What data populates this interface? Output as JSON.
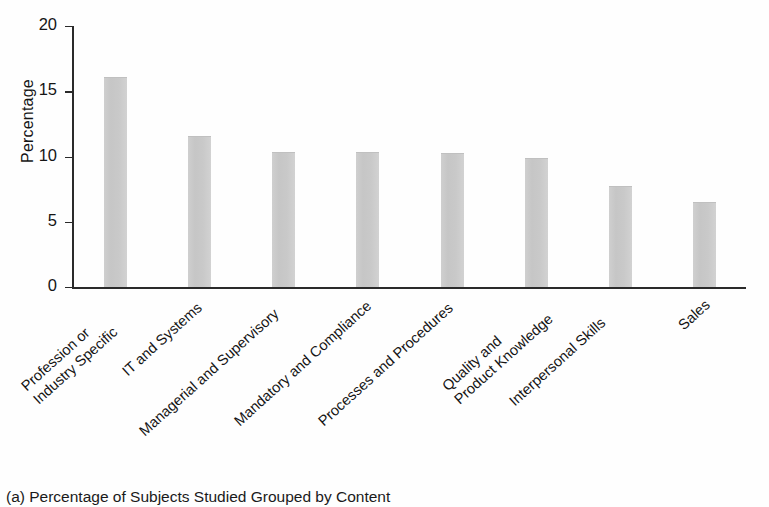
{
  "figure": {
    "background_color": "#fefefe",
    "axis_color": "#2a2a2a",
    "bar_color": "#c9c9c9"
  },
  "caption": {
    "text": "(a) Percentage of Subjects Studied Grouped by Content"
  },
  "chart_data": {
    "type": "bar",
    "title": "",
    "xlabel": "",
    "ylabel": "Percentage",
    "ylim": [
      0,
      20
    ],
    "yticks": [
      0,
      5,
      10,
      15,
      20
    ],
    "ytick_labels": [
      "0",
      "5",
      "10",
      "15",
      "20"
    ],
    "grid": false,
    "legend": false,
    "orientation": "vertical",
    "xtick_rotation_degrees": -42,
    "categories": [
      "Profession or Industry Specific",
      "IT and Systems",
      "Managerial and Supervisory",
      "Mandatory and Compliance",
      "Processes and Procedures",
      "Quality and Product Knowledge",
      "Interpersonal Skills",
      "Sales"
    ],
    "category_lines": [
      [
        "Profession or",
        "Industry Specific"
      ],
      [
        "IT and Systems"
      ],
      [
        "Managerial and Supervisory"
      ],
      [
        "Mandatory and Compliance"
      ],
      [
        "Processes and Procedures"
      ],
      [
        "Quality and",
        "Product Knowledge"
      ],
      [
        "Interpersonal Skills"
      ],
      [
        "Sales"
      ]
    ],
    "values": [
      16.0,
      11.5,
      10.3,
      10.3,
      10.2,
      9.8,
      7.7,
      6.4
    ]
  }
}
